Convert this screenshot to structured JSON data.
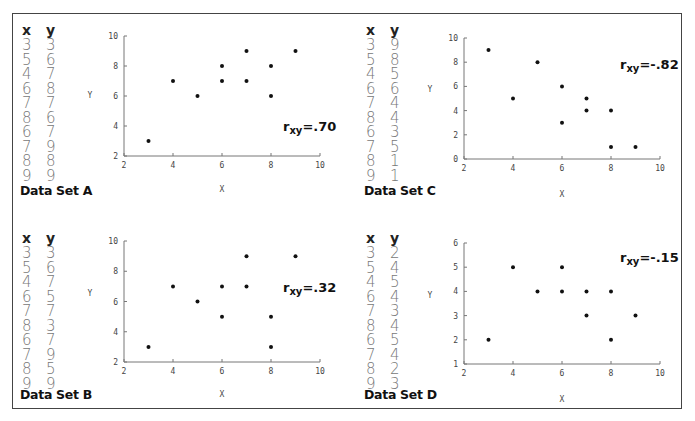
{
  "figure": {
    "panels": [
      {
        "id": "A",
        "caption": "Data Set A",
        "col_x": "x",
        "col_y": "y",
        "x": [
          3,
          5,
          4,
          6,
          7,
          8,
          6,
          7,
          8,
          9
        ],
        "y": [
          3,
          6,
          7,
          8,
          7,
          6,
          7,
          9,
          8,
          9
        ],
        "r_label": "r",
        "r_sub": "xy",
        "r_value": "=.70"
      },
      {
        "id": "B",
        "caption": "Data Set B",
        "col_x": "x",
        "col_y": "y",
        "x": [
          3,
          5,
          4,
          6,
          7,
          8,
          6,
          7,
          8,
          9
        ],
        "y": [
          3,
          6,
          7,
          5,
          7,
          3,
          7,
          9,
          5,
          9
        ],
        "r_label": "r",
        "r_sub": "xy",
        "r_value": "=.32"
      },
      {
        "id": "C",
        "caption": "Data Set C",
        "col_x": "x",
        "col_y": "y",
        "x": [
          3,
          5,
          4,
          6,
          7,
          8,
          6,
          7,
          8,
          9
        ],
        "y": [
          9,
          8,
          5,
          6,
          4,
          4,
          3,
          5,
          1,
          1
        ],
        "r_label": "r",
        "r_sub": "xy",
        "r_value": "=-.82"
      },
      {
        "id": "D",
        "caption": "Data Set D",
        "col_x": "x",
        "col_y": "y",
        "x": [
          3,
          5,
          4,
          6,
          7,
          8,
          6,
          7,
          8,
          9
        ],
        "y": [
          2,
          4,
          5,
          4,
          3,
          4,
          5,
          4,
          2,
          3
        ],
        "r_label": "r",
        "r_sub": "xy",
        "r_value": "=-.15"
      }
    ]
  },
  "chart_data": [
    {
      "type": "scatter",
      "title": "Data Set A",
      "xlabel": "X",
      "ylabel": "Y",
      "x": [
        3,
        5,
        4,
        6,
        7,
        8,
        6,
        7,
        8,
        9
      ],
      "y": [
        3,
        6,
        7,
        8,
        7,
        6,
        7,
        9,
        8,
        9
      ],
      "xlim": [
        2,
        10
      ],
      "ylim": [
        2,
        10
      ],
      "xticks": [
        2,
        4,
        6,
        8,
        10
      ],
      "yticks": [
        2,
        4,
        6,
        8,
        10
      ],
      "annotation": "r_xy=.70",
      "grid": false
    },
    {
      "type": "scatter",
      "title": "Data Set B",
      "xlabel": "X",
      "ylabel": "Y",
      "x": [
        3,
        5,
        4,
        6,
        7,
        8,
        6,
        7,
        8,
        9
      ],
      "y": [
        3,
        6,
        7,
        5,
        7,
        3,
        7,
        9,
        5,
        9
      ],
      "xlim": [
        2,
        10
      ],
      "ylim": [
        2,
        10
      ],
      "xticks": [
        2,
        4,
        6,
        8,
        10
      ],
      "yticks": [
        2,
        4,
        6,
        8,
        10
      ],
      "annotation": "r_xy=.32",
      "grid": false
    },
    {
      "type": "scatter",
      "title": "Data Set C",
      "xlabel": "X",
      "ylabel": "Y",
      "x": [
        3,
        5,
        4,
        6,
        7,
        8,
        6,
        7,
        8,
        9
      ],
      "y": [
        9,
        8,
        5,
        6,
        4,
        4,
        3,
        5,
        1,
        1
      ],
      "xlim": [
        2,
        10
      ],
      "ylim": [
        0,
        10
      ],
      "xticks": [
        2,
        4,
        6,
        8,
        10
      ],
      "yticks": [
        0,
        2,
        4,
        6,
        8,
        10
      ],
      "annotation": "r_xy=-.82",
      "grid": false
    },
    {
      "type": "scatter",
      "title": "Data Set D",
      "xlabel": "X",
      "ylabel": "Y",
      "x": [
        3,
        5,
        4,
        6,
        7,
        8,
        6,
        7,
        8,
        9
      ],
      "y": [
        2,
        4,
        5,
        4,
        3,
        4,
        5,
        4,
        2,
        3
      ],
      "xlim": [
        2,
        10
      ],
      "ylim": [
        1,
        6
      ],
      "xticks": [
        2,
        4,
        6,
        8,
        10
      ],
      "yticks": [
        1,
        2,
        3,
        4,
        5,
        6
      ],
      "annotation": "r_xy=-.15",
      "grid": false
    }
  ]
}
